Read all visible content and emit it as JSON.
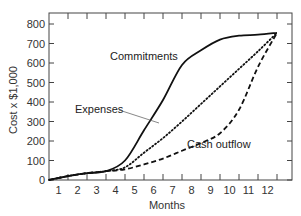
{
  "chart_data": {
    "type": "line",
    "title": "",
    "xlabel": "Months",
    "ylabel": "Cost x $1,000",
    "x": [
      0,
      1,
      2,
      3,
      4,
      5,
      6,
      7,
      8,
      9,
      10,
      11,
      12
    ],
    "x_tick_labels": [
      "1",
      "2",
      "3",
      "4",
      "5",
      "6",
      "7",
      "8",
      "9",
      "10",
      "11",
      "12"
    ],
    "y_ticks": [
      0,
      100,
      200,
      300,
      400,
      500,
      600,
      700,
      800
    ],
    "ylim": [
      0,
      850
    ],
    "xlim": [
      0,
      12.9
    ],
    "grid": false,
    "legend": "inline labels",
    "series": [
      {
        "name": "Commitments",
        "style": "solid",
        "values": [
          0,
          20,
          35,
          45,
          100,
          255,
          410,
          590,
          665,
          720,
          740,
          745,
          755
        ]
      },
      {
        "name": "Expenses",
        "style": "dotted",
        "values": [
          0,
          20,
          35,
          45,
          65,
          140,
          215,
          300,
          390,
          480,
          570,
          660,
          755
        ]
      },
      {
        "name": "Cash outflow",
        "style": "dashed",
        "values": [
          0,
          20,
          35,
          45,
          55,
          80,
          110,
          150,
          190,
          240,
          360,
          580,
          755
        ]
      }
    ],
    "annotations": [
      {
        "text": "Commitments",
        "x": 6.2,
        "y": 640
      },
      {
        "text": "Expenses",
        "x": 2.4,
        "y": 370
      },
      {
        "text": "Cash outflow",
        "x": 8.7,
        "y": 180
      }
    ]
  },
  "labels": {
    "y_axis_title": "Cost x $1,000",
    "x_axis_title": "Months",
    "commitments": "Commitments",
    "expenses": "Expenses",
    "cash_outflow": "Cash outflow"
  },
  "colors": {
    "line": "#111111",
    "axis": "#444444",
    "text": "#333333"
  }
}
